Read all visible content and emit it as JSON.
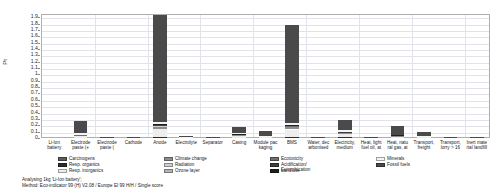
{
  "chart_data": {
    "type": "bar",
    "title": "",
    "xlabel": "",
    "ylabel": "Pt",
    "ylim": [
      0,
      1.95
    ],
    "grid": true,
    "legend_position": "bottom",
    "stacked": true,
    "yticks": [
      "0",
      "0.1",
      "0.2",
      "0.3",
      "0.4",
      "0.5",
      "0.6",
      "0.7",
      "0.8",
      "0.9",
      "1",
      "1.1",
      "1.2",
      "1.3",
      "1.4",
      "1.5",
      "1.6",
      "1.7",
      "1.8",
      "1.9"
    ],
    "categories": [
      "Li-Ion\nbattery",
      "Electrode\npaste (+",
      "Electrode\npaste (",
      "Cathode",
      "Anode",
      "Electrolyte",
      "Separator",
      "Casing",
      "Module pac\nkaging",
      "BMS",
      "Water, dec\narbonised",
      "Electricity,\nmedium",
      "Heat, light\nfuel oil, at",
      "Heat, natu\nral gas, at",
      "Transport,\nfreight",
      "Transport,\nlorry > 16",
      "Inert mate\nrial landfill"
    ],
    "series": [
      {
        "name": "Carcinogens",
        "color": "#5c5c5c",
        "values": [
          0.0,
          0.006,
          0.0,
          0.001,
          0.01,
          0.001,
          0.0,
          0.006,
          0.003,
          0.01,
          0.0,
          0.01,
          0.001,
          0.004,
          0.002,
          0.0,
          0.0
        ]
      },
      {
        "name": "Resp. organics",
        "color": "#2e2e2e",
        "values": [
          0.0,
          0.002,
          0.0,
          0.0,
          0.004,
          0.0,
          0.0,
          0.002,
          0.001,
          0.004,
          0.0,
          0.003,
          0.0,
          0.002,
          0.001,
          0.0,
          0.0
        ]
      },
      {
        "name": "Resp. inorganics",
        "color": "#ededed",
        "values": [
          0.0,
          0.022,
          0.001,
          0.002,
          0.13,
          0.003,
          0.001,
          0.028,
          0.012,
          0.12,
          0.0,
          0.045,
          0.003,
          0.02,
          0.012,
          0.001,
          0.001
        ]
      },
      {
        "name": "Climate change",
        "color": "#8e8e8e",
        "values": [
          0.0,
          0.012,
          0.0,
          0.001,
          0.04,
          0.001,
          0.0,
          0.012,
          0.006,
          0.04,
          0.0,
          0.02,
          0.002,
          0.01,
          0.006,
          0.0,
          0.0
        ]
      },
      {
        "name": "Radiation",
        "color": "#cfcfcf",
        "values": [
          0.0,
          0.002,
          0.0,
          0.0,
          0.004,
          0.0,
          0.0,
          0.002,
          0.001,
          0.004,
          0.0,
          0.004,
          0.0,
          0.001,
          0.001,
          0.0,
          0.0
        ]
      },
      {
        "name": "Ozone layer",
        "color": "#b5b5b5",
        "values": [
          0.0,
          0.001,
          0.0,
          0.0,
          0.002,
          0.0,
          0.0,
          0.001,
          0.001,
          0.002,
          0.0,
          0.001,
          0.0,
          0.001,
          0.0,
          0.0,
          0.0
        ]
      },
      {
        "name": "Ecotoxicity",
        "color": "#6f6f6f",
        "values": [
          0.0,
          0.004,
          0.0,
          0.001,
          0.01,
          0.001,
          0.0,
          0.005,
          0.002,
          0.01,
          0.0,
          0.008,
          0.001,
          0.003,
          0.002,
          0.0,
          0.0
        ]
      },
      {
        "name": "Acidification/\nEutrophication",
        "color": "#3f3f3f",
        "values": [
          0.0,
          0.004,
          0.0,
          0.001,
          0.01,
          0.001,
          0.0,
          0.004,
          0.002,
          0.01,
          0.0,
          0.008,
          0.001,
          0.003,
          0.002,
          0.0,
          0.0
        ]
      },
      {
        "name": "Land use",
        "color": "#1f1f1f",
        "values": [
          0.0,
          0.002,
          0.0,
          0.0,
          0.005,
          0.0,
          0.0,
          0.002,
          0.001,
          0.005,
          0.0,
          0.003,
          0.0,
          0.002,
          0.001,
          0.0,
          0.0
        ]
      },
      {
        "name": "Minerals",
        "color": "#f4f4f4",
        "values": [
          0.0,
          0.018,
          0.001,
          0.002,
          0.03,
          0.002,
          0.001,
          0.022,
          0.008,
          0.03,
          0.0,
          0.018,
          0.002,
          0.008,
          0.005,
          0.001,
          0.001
        ]
      },
      {
        "name": "Fossil fuels",
        "color": "#4a4a4a",
        "values": [
          0.0,
          0.187,
          0.008,
          0.013,
          1.685,
          0.021,
          0.007,
          0.096,
          0.076,
          1.545,
          0.001,
          0.16,
          0.01,
          0.136,
          0.07,
          0.004,
          0.003
        ]
      }
    ],
    "bar_totals": [
      0.0,
      0.26,
      0.01,
      0.021,
      1.93,
      0.03,
      0.009,
      0.18,
      0.113,
      1.78,
      0.001,
      0.28,
      0.02,
      0.19,
      0.102,
      0.006,
      0.005
    ]
  },
  "legend": {
    "items": [
      {
        "label": "Carcinogens"
      },
      {
        "label": "Resp. organics"
      },
      {
        "label": "Resp. inorganics"
      },
      {
        "label": "Climate change"
      },
      {
        "label": "Radiation"
      },
      {
        "label": "Ozone layer"
      },
      {
        "label": "Ecotoxicity"
      },
      {
        "label": "Acidification/\nEutrophication"
      },
      {
        "label": "Land use"
      },
      {
        "label": "Minerals"
      },
      {
        "label": "Fossil fuels"
      }
    ]
  },
  "caption": {
    "line1": "Analysing 1kg 'Li-Ion battery';",
    "line2": "Method: Eco-indicator 99 (H) V2.08 / Europe EI 99 H/H / Single score"
  }
}
